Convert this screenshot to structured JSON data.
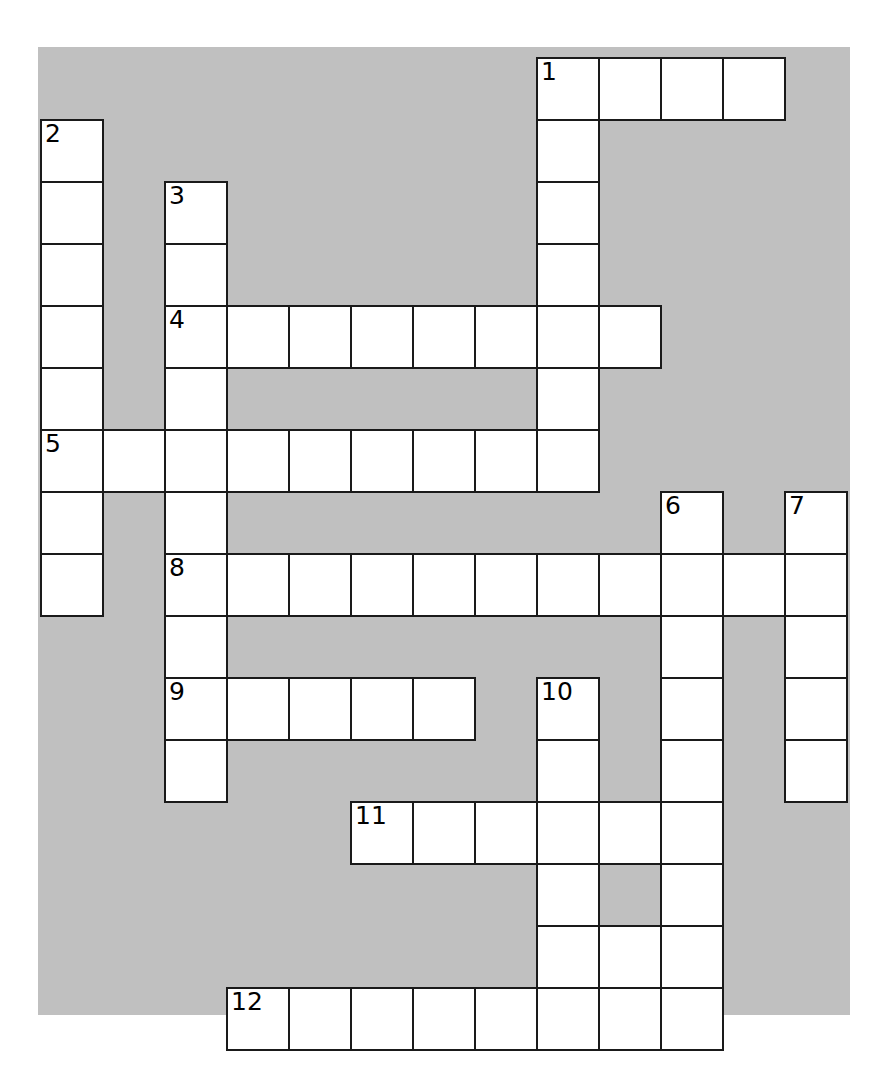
{
  "puzzle": {
    "kind": "crossword-grid",
    "title": "Crossword puzzle grid",
    "image_width": 890,
    "image_height": 1070,
    "colors": {
      "background": "#c0c0c0",
      "cell_fill": "#ffffff",
      "cell_border": "#1a1a1a",
      "number_text": "#000000",
      "page": "#ffffff"
    },
    "geometry": {
      "origin_x": 40,
      "origin_y": 57,
      "cell_size": 62,
      "columns": 13,
      "rows": 16,
      "board_left": 38,
      "board_top": 47,
      "board_width": 812,
      "board_height": 968
    },
    "clue_numbers": [
      "1",
      "2",
      "3",
      "4",
      "5",
      "6",
      "7",
      "8",
      "9",
      "10",
      "11",
      "12"
    ],
    "entries": [
      {
        "number": "1",
        "direction": "across",
        "row": 0,
        "col": 8,
        "length": 4
      },
      {
        "number": "1",
        "direction": "down",
        "row": 0,
        "col": 8,
        "length": 8
      },
      {
        "number": "2",
        "direction": "down",
        "row": 1,
        "col": 0,
        "length": 8
      },
      {
        "number": "3",
        "direction": "down",
        "row": 2,
        "col": 2,
        "length": 10
      },
      {
        "number": "4",
        "direction": "across",
        "row": 4,
        "col": 2,
        "length": 8
      },
      {
        "number": "5",
        "direction": "across",
        "row": 6,
        "col": 0,
        "length": 9
      },
      {
        "number": "6",
        "direction": "down",
        "row": 7,
        "col": 10,
        "length": 9
      },
      {
        "number": "7",
        "direction": "down",
        "row": 7,
        "col": 12,
        "length": 5
      },
      {
        "number": "8",
        "direction": "across",
        "row": 8,
        "col": 2,
        "length": 11
      },
      {
        "number": "9",
        "direction": "across",
        "row": 10,
        "col": 2,
        "length": 5
      },
      {
        "number": "10",
        "direction": "down",
        "row": 10,
        "col": 8,
        "length": 6
      },
      {
        "number": "11",
        "direction": "across",
        "row": 12,
        "col": 5,
        "length": 6
      },
      {
        "number": "12",
        "direction": "across",
        "row": 15,
        "col": 3,
        "length": 8
      }
    ],
    "cells": [
      {
        "row": 0,
        "col": 8,
        "num": "1"
      },
      {
        "row": 0,
        "col": 9
      },
      {
        "row": 0,
        "col": 10
      },
      {
        "row": 0,
        "col": 11
      },
      {
        "row": 1,
        "col": 0,
        "num": "2"
      },
      {
        "row": 1,
        "col": 8
      },
      {
        "row": 2,
        "col": 0
      },
      {
        "row": 2,
        "col": 2,
        "num": "3"
      },
      {
        "row": 2,
        "col": 8
      },
      {
        "row": 3,
        "col": 0
      },
      {
        "row": 3,
        "col": 2
      },
      {
        "row": 3,
        "col": 8
      },
      {
        "row": 4,
        "col": 0
      },
      {
        "row": 4,
        "col": 2,
        "num": "4"
      },
      {
        "row": 4,
        "col": 3
      },
      {
        "row": 4,
        "col": 4
      },
      {
        "row": 4,
        "col": 5
      },
      {
        "row": 4,
        "col": 6
      },
      {
        "row": 4,
        "col": 7
      },
      {
        "row": 4,
        "col": 8
      },
      {
        "row": 4,
        "col": 9
      },
      {
        "row": 5,
        "col": 0
      },
      {
        "row": 5,
        "col": 2
      },
      {
        "row": 5,
        "col": 8
      },
      {
        "row": 6,
        "col": 0,
        "num": "5"
      },
      {
        "row": 6,
        "col": 1
      },
      {
        "row": 6,
        "col": 2
      },
      {
        "row": 6,
        "col": 3
      },
      {
        "row": 6,
        "col": 4
      },
      {
        "row": 6,
        "col": 5
      },
      {
        "row": 6,
        "col": 6
      },
      {
        "row": 6,
        "col": 7
      },
      {
        "row": 6,
        "col": 8
      },
      {
        "row": 7,
        "col": 0
      },
      {
        "row": 7,
        "col": 2
      },
      {
        "row": 7,
        "col": 10,
        "num": "6"
      },
      {
        "row": 7,
        "col": 12,
        "num": "7"
      },
      {
        "row": 8,
        "col": 0
      },
      {
        "row": 8,
        "col": 2,
        "num": "8"
      },
      {
        "row": 8,
        "col": 3
      },
      {
        "row": 8,
        "col": 4
      },
      {
        "row": 8,
        "col": 5
      },
      {
        "row": 8,
        "col": 6
      },
      {
        "row": 8,
        "col": 7
      },
      {
        "row": 8,
        "col": 8
      },
      {
        "row": 8,
        "col": 9
      },
      {
        "row": 8,
        "col": 10
      },
      {
        "row": 8,
        "col": 11
      },
      {
        "row": 8,
        "col": 12
      },
      {
        "row": 9,
        "col": 2
      },
      {
        "row": 9,
        "col": 10
      },
      {
        "row": 9,
        "col": 12
      },
      {
        "row": 10,
        "col": 2,
        "num": "9"
      },
      {
        "row": 10,
        "col": 3
      },
      {
        "row": 10,
        "col": 4
      },
      {
        "row": 10,
        "col": 5
      },
      {
        "row": 10,
        "col": 6
      },
      {
        "row": 10,
        "col": 8,
        "num": "10"
      },
      {
        "row": 10,
        "col": 10
      },
      {
        "row": 10,
        "col": 12
      },
      {
        "row": 11,
        "col": 2
      },
      {
        "row": 11,
        "col": 8
      },
      {
        "row": 11,
        "col": 10
      },
      {
        "row": 11,
        "col": 12
      },
      {
        "row": 12,
        "col": 5,
        "num": "11"
      },
      {
        "row": 12,
        "col": 6
      },
      {
        "row": 12,
        "col": 7
      },
      {
        "row": 12,
        "col": 8
      },
      {
        "row": 12,
        "col": 9
      },
      {
        "row": 12,
        "col": 10
      },
      {
        "row": 13,
        "col": 8
      },
      {
        "row": 13,
        "col": 10
      },
      {
        "row": 14,
        "col": 8
      },
      {
        "row": 14,
        "col": 9
      },
      {
        "row": 14,
        "col": 10
      },
      {
        "row": 15,
        "col": 3,
        "num": "12"
      },
      {
        "row": 15,
        "col": 4
      },
      {
        "row": 15,
        "col": 5
      },
      {
        "row": 15,
        "col": 6
      },
      {
        "row": 15,
        "col": 7
      },
      {
        "row": 15,
        "col": 8
      },
      {
        "row": 15,
        "col": 9
      },
      {
        "row": 15,
        "col": 10
      }
    ]
  }
}
